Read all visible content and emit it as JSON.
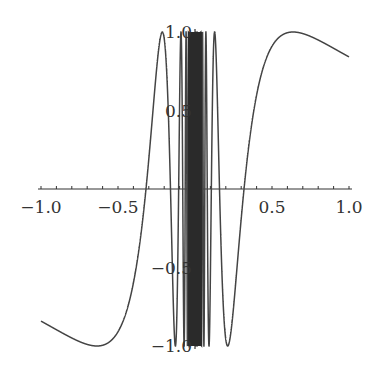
{
  "chart_data": {
    "type": "line",
    "title": "",
    "function": "sin(1/x)",
    "xlabel": "",
    "ylabel": "",
    "xlim": [
      -1.0,
      1.0
    ],
    "ylim": [
      -1.0,
      1.0
    ],
    "grid": false,
    "legend": null,
    "x_tick_labels": [
      "−1.0",
      "−0.5",
      "0.5",
      "1.0"
    ],
    "x_tick_values": [
      -1.0,
      -0.5,
      0.5,
      1.0
    ],
    "y_tick_labels": [
      "1.0",
      "0.5",
      "−0.5",
      "−1.0"
    ],
    "y_tick_values": [
      1.0,
      0.5,
      -0.5,
      -1.0
    ],
    "minor_tick_step": 0.1,
    "series": [
      {
        "name": "sin(1/x)",
        "color": "#444444",
        "x_range": [
          -1.0,
          1.0
        ]
      }
    ]
  },
  "colors": {
    "curve": "#444444",
    "axis": "#333333"
  }
}
